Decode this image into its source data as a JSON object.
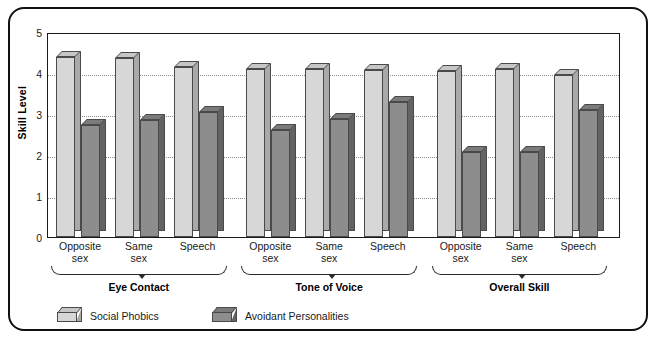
{
  "chart_data": {
    "type": "bar",
    "title": "",
    "subtitle": "",
    "xlabel": "",
    "ylabel": "Skill Level",
    "ylim": [
      0,
      5
    ],
    "yticks": [
      0,
      1,
      2,
      3,
      4,
      5
    ],
    "ytick_labels": [
      "0",
      "1",
      "2",
      "3",
      "4",
      "5"
    ],
    "grid": "horizontal-dotted",
    "legend_position": "bottom-left",
    "categories": [
      "Opposite\nsex",
      "Same\nsex",
      "Speech",
      "Opposite\nsex",
      "Same\nsex",
      "Speech",
      "Opposite\nsex",
      "Same\nsex",
      "Speech"
    ],
    "group_labels": [
      "Eye Contact",
      "Tone of Voice",
      "Overall Skill"
    ],
    "series": [
      {
        "name": "Social Phobics",
        "color": "#d7d7d7",
        "values": [
          4.4,
          4.37,
          4.15,
          4.1,
          4.1,
          4.07,
          4.05,
          4.1,
          3.95
        ]
      },
      {
        "name": "Avoidant Personalities",
        "color": "#8d8d8d",
        "values": [
          2.72,
          2.85,
          3.05,
          2.62,
          2.87,
          3.3,
          2.07,
          2.07,
          3.1
        ]
      }
    ]
  },
  "legend": {
    "items": [
      {
        "label": "Social Phobics",
        "swatch": "light"
      },
      {
        "label": "Avoidant Personalities",
        "swatch": "dark"
      }
    ]
  },
  "axis": {
    "y_title": "Skill Level"
  }
}
